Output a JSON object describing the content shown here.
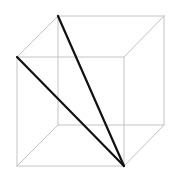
{
  "diagram": {
    "title": "",
    "type": "wireframe-cube-with-diagonals",
    "canvas": {
      "width": 169,
      "height": 176,
      "background": "#ffffff"
    },
    "colors": {
      "edge": "#c4c4c4",
      "diagonal": "#111111"
    },
    "vertices": {
      "front_top_left": [
        17,
        57
      ],
      "front_top_right": [
        124,
        57
      ],
      "front_bottom_left": [
        17,
        166
      ],
      "front_bottom_right": [
        124,
        166
      ],
      "back_top_left": [
        58,
        16
      ],
      "back_top_right": [
        164,
        16
      ],
      "back_bottom_left": [
        58,
        125
      ],
      "back_bottom_right": [
        164,
        125
      ]
    },
    "edges": [
      [
        "front_top_left",
        "front_top_right"
      ],
      [
        "front_top_right",
        "front_bottom_right"
      ],
      [
        "front_bottom_right",
        "front_bottom_left"
      ],
      [
        "front_bottom_left",
        "front_top_left"
      ],
      [
        "back_top_left",
        "back_top_right"
      ],
      [
        "back_top_right",
        "back_bottom_right"
      ],
      [
        "back_bottom_right",
        "back_bottom_left"
      ],
      [
        "back_bottom_left",
        "back_top_left"
      ],
      [
        "front_top_left",
        "back_top_left"
      ],
      [
        "front_top_right",
        "back_top_right"
      ],
      [
        "front_bottom_left",
        "back_bottom_left"
      ],
      [
        "front_bottom_right",
        "back_bottom_right"
      ]
    ],
    "diagonals": [
      [
        "back_top_left",
        "front_bottom_right"
      ],
      [
        "front_top_left",
        "front_bottom_right"
      ]
    ]
  }
}
